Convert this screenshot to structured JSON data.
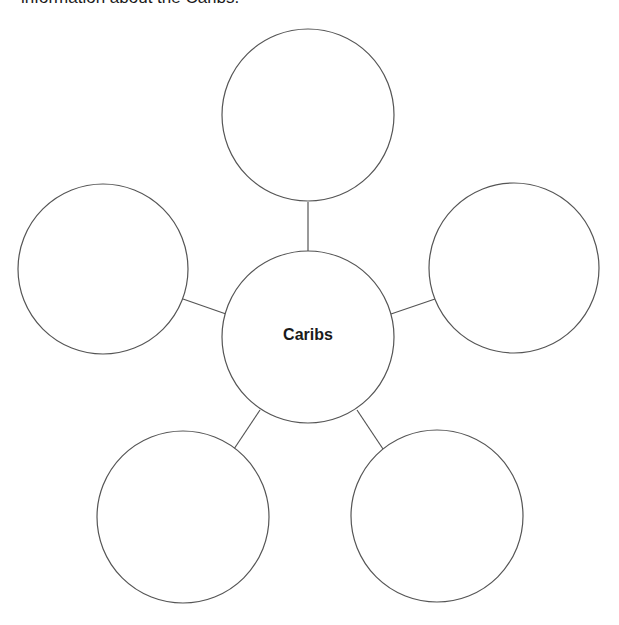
{
  "instruction": "information about the Caribs.",
  "diagram": {
    "type": "spider-web-graphic-organizer",
    "center": {
      "label": "Caribs",
      "cx": 308,
      "cy": 337,
      "r": 86
    },
    "outer_circles": [
      {
        "position": "top",
        "cx": 308,
        "cy": 115,
        "r": 86,
        "text": ""
      },
      {
        "position": "left",
        "cx": 103,
        "cy": 269,
        "r": 85,
        "text": ""
      },
      {
        "position": "right",
        "cx": 514,
        "cy": 268,
        "r": 85,
        "text": ""
      },
      {
        "position": "bottom-left",
        "cx": 183,
        "cy": 517,
        "r": 86,
        "text": ""
      },
      {
        "position": "bottom-right",
        "cx": 437,
        "cy": 516,
        "r": 86,
        "text": ""
      }
    ],
    "stroke_color": "#555555"
  }
}
